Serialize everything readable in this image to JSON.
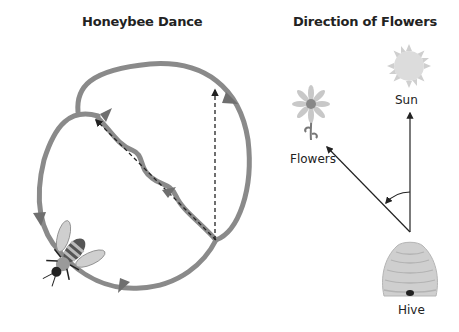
{
  "panels": {
    "left": {
      "title": "Honeybee Dance",
      "elements": [
        "waggle-dance-path",
        "return-loop-left",
        "return-loop-right",
        "vertical-reference-line",
        "bee"
      ]
    },
    "right": {
      "title": "Direction of Flowers",
      "labels": {
        "sun": "Sun",
        "flowers": "Flowers",
        "hive": "Hive"
      }
    }
  },
  "colors": {
    "path": "#8a8a8a",
    "arrow": "#6f6f6f",
    "line": "#222222",
    "sun": "#d9d9d9",
    "hive": "#cfcfcf"
  }
}
